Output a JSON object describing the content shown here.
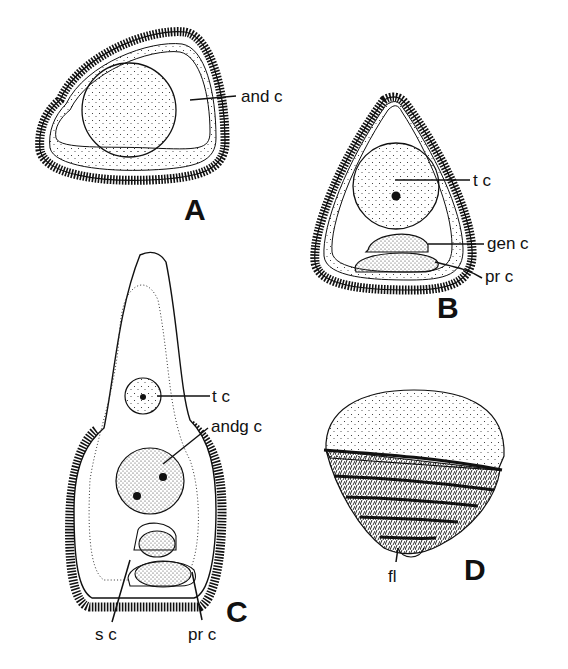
{
  "figure": {
    "panels": [
      {
        "id": "A",
        "letter": "A",
        "labels": [
          "and c"
        ]
      },
      {
        "id": "B",
        "letter": "B",
        "labels": [
          "t c",
          "gen c",
          "pr c"
        ]
      },
      {
        "id": "C",
        "letter": "C",
        "labels": [
          "t c",
          "andg c",
          "s c",
          "pr c"
        ]
      },
      {
        "id": "D",
        "letter": "D",
        "labels": [
          "fl"
        ]
      }
    ]
  },
  "colors": {
    "ink": "#111111",
    "background": "#ffffff"
  }
}
